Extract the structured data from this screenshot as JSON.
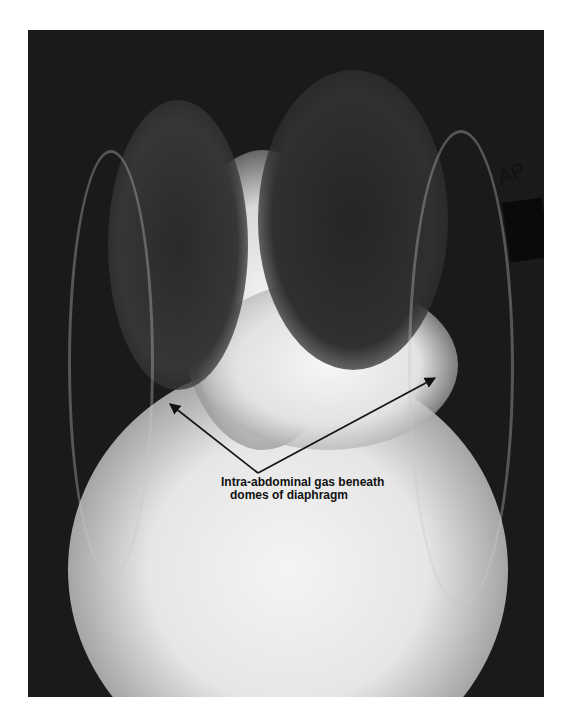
{
  "figure": {
    "type": "chest radiograph (AP view)",
    "marker_text": "AP",
    "annotation": {
      "line1": "Intra-abdominal gas beneath",
      "line2": "domes of diaphragm",
      "arrow_color": "#111111",
      "arrows": [
        {
          "from": [
            258,
            473
          ],
          "to": [
            170,
            404
          ]
        },
        {
          "from": [
            258,
            473
          ],
          "to": [
            435,
            378
          ]
        }
      ]
    }
  }
}
